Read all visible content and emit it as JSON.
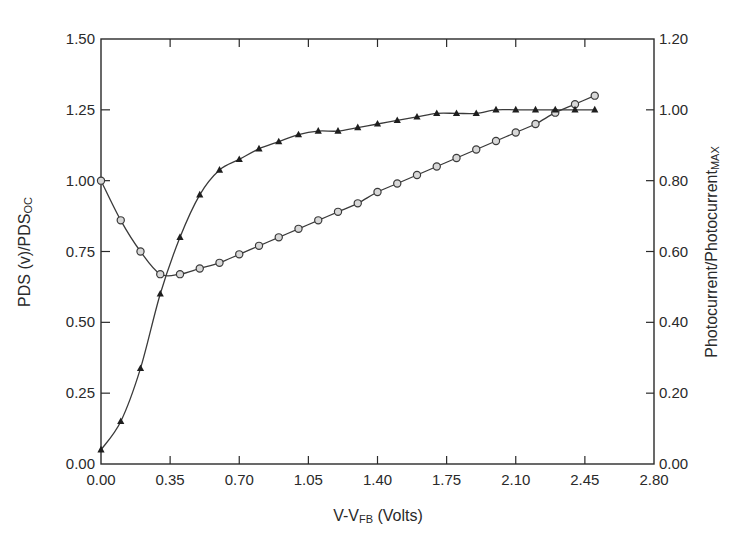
{
  "chart_data": {
    "type": "line",
    "title": "",
    "xlabel": "V-V_FB (Volts)",
    "xlabel_parts": {
      "main": "V-V",
      "sub": "FB",
      "tail": " (Volts)"
    },
    "ylabel_left": "PDS (v)/PDS_OC",
    "ylabel_left_parts": {
      "main": "PDS (v)/PDS",
      "sub": "OC"
    },
    "ylabel_right": "Photocurrent/Photocurrent_MAX",
    "ylabel_right_parts": {
      "main": "Photocurrent/Photocurrent",
      "sub": "MAX"
    },
    "xlim": [
      0,
      2.8
    ],
    "ylim_left": [
      0,
      1.5
    ],
    "ylim_right": [
      0,
      1.2
    ],
    "x_ticks": [
      "0.00",
      "0.35",
      "0.70",
      "1.05",
      "1.40",
      "1.75",
      "2.10",
      "2.45",
      "2.80"
    ],
    "y_ticks_left": [
      "0.00",
      "0.25",
      "0.50",
      "0.75",
      "1.00",
      "1.25",
      "1.50"
    ],
    "y_ticks_right": [
      "0.00",
      "0.20",
      "0.40",
      "0.60",
      "0.80",
      "1.00",
      "1.20"
    ],
    "grid": false,
    "legend": null,
    "x": [
      0.0,
      0.1,
      0.2,
      0.3,
      0.4,
      0.5,
      0.6,
      0.7,
      0.8,
      0.9,
      1.0,
      1.1,
      1.2,
      1.3,
      1.4,
      1.5,
      1.6,
      1.7,
      1.8,
      1.9,
      2.0,
      2.1,
      2.2,
      2.3,
      2.4,
      2.5
    ],
    "series": [
      {
        "name": "PDS(v)/PDS_OC",
        "axis": "left",
        "marker": "open-circle",
        "values": [
          1.0,
          0.86,
          0.75,
          0.67,
          0.67,
          0.69,
          0.71,
          0.74,
          0.77,
          0.8,
          0.83,
          0.86,
          0.89,
          0.92,
          0.96,
          0.99,
          1.02,
          1.05,
          1.08,
          1.11,
          1.14,
          1.17,
          1.2,
          1.24,
          1.27,
          1.3
        ]
      },
      {
        "name": "Photocurrent/Photocurrent_MAX",
        "axis": "right",
        "marker": "filled-triangle",
        "values": [
          0.04,
          0.12,
          0.27,
          0.48,
          0.64,
          0.76,
          0.83,
          0.86,
          0.89,
          0.91,
          0.93,
          0.94,
          0.94,
          0.95,
          0.96,
          0.97,
          0.98,
          0.99,
          0.99,
          0.99,
          1.0,
          1.0,
          1.0,
          1.0,
          1.0,
          1.0
        ]
      }
    ]
  },
  "colors": {
    "line": "#3a3a3a",
    "axis": "#2a2a2a",
    "marker_fill_circle": "#d8d8d8",
    "marker_fill_triangle": "#1e1e1e"
  }
}
